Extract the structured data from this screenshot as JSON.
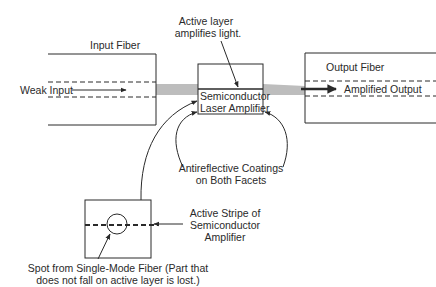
{
  "diagram": {
    "type": "semiconductor-laser-amplifier",
    "colors": {
      "line": "#2a2a2a",
      "beam": "#bdbdbd",
      "background": "#ffffff"
    },
    "input_fiber": {
      "label": "Input Fiber",
      "signal_label": "Weak Input"
    },
    "output_fiber": {
      "label": "Output Fiber",
      "signal_label": "Amplified Output"
    },
    "amplifier": {
      "label_line1": "Semiconductor",
      "label_line2": "Laser Amplifier",
      "active_layer_note_line1": "Active layer",
      "active_layer_note_line2": "amplifies light."
    },
    "coatings": {
      "line1": "Antireflective Coatings",
      "line2": "on Both Facets"
    },
    "facet_view": {
      "stripe_line1": "Active Stripe of",
      "stripe_line2": "Semiconductor",
      "stripe_line3": "Amplifier",
      "spot_line1": "Spot from Single-Mode Fiber (Part that",
      "spot_line2": "does not fall on active layer is lost.)"
    }
  }
}
